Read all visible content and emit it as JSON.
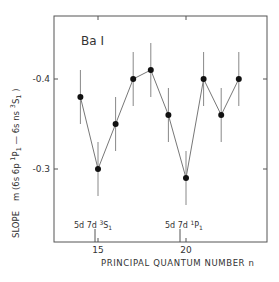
{
  "chart_data": {
    "type": "scatter",
    "title": "",
    "annotation_element": "Ba I",
    "xlabel": "PRINCIPAL QUANTUM NUMBER n",
    "ylabel_prefix": "SLOPE",
    "ylabel": "m (6s 6p 1P1 — 6s ns 3S1)",
    "xlim": [
      12.5,
      25
    ],
    "ylim": [
      -0.445,
      -0.263
    ],
    "y_inverted": true,
    "x_ticks": [
      15,
      20
    ],
    "x_tick_labels": [
      "15",
      "20"
    ],
    "y_ticks": [
      -0.4,
      -0.3
    ],
    "y_tick_labels": [
      "-0.4",
      "-0.3"
    ],
    "grid": false,
    "legend": null,
    "series": [
      {
        "name": "Ba I slope",
        "style": "markers connected by line with vertical error bars",
        "x": [
          14,
          15,
          16,
          17,
          18,
          19,
          20,
          21,
          22,
          23
        ],
        "y": [
          -0.38,
          -0.3,
          -0.35,
          -0.4,
          -0.41,
          -0.36,
          -0.29,
          -0.4,
          -0.36,
          -0.4
        ],
        "yerr": [
          0.03,
          0.03,
          0.03,
          0.03,
          0.03,
          0.03,
          0.03,
          0.03,
          0.03,
          0.03
        ]
      }
    ],
    "perturber_markers": [
      {
        "x": 14.8,
        "label_main": "5d 7d ",
        "label_sup": "3",
        "label_term": "S",
        "label_sub": "1"
      },
      {
        "x": 19.65,
        "label_main": "5d 7d ",
        "label_sup": "1",
        "label_term": "P",
        "label_sub": "1"
      }
    ]
  },
  "labels": {
    "element": "Ba I",
    "xaxis": "PRINCIPAL QUANTUM NUMBER n",
    "slope": "SLOPE",
    "ylabel_m": "m (6s 6p ",
    "ylabel_sup1": "1",
    "ylabel_P": "P",
    "ylabel_sub1": "1",
    "ylabel_mid": " — 6s ns ",
    "ylabel_sup3": "3",
    "ylabel_S": "S",
    "ylabel_sub2": "1",
    "ylabel_close": " )",
    "ytick_04": "-0.4",
    "ytick_03": "-0.3",
    "xtick_15": "15",
    "xtick_20": "20",
    "marker1_main": "5d 7d ",
    "marker1_sup": "3",
    "marker1_term": "S",
    "marker1_sub": "1",
    "marker2_main": "5d 7d ",
    "marker2_sup": "1",
    "marker2_term": "P",
    "marker2_sub": "1"
  },
  "colors": {
    "frame": "#555555",
    "line": "#777777",
    "marker": "#111111",
    "errorbar": "#888888",
    "text": "#333333"
  }
}
